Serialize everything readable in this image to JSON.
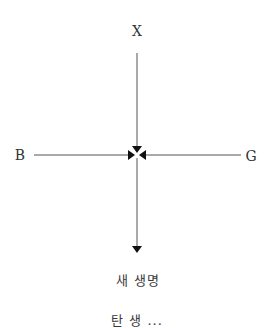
{
  "diagram": {
    "nodes": {
      "top": {
        "label": "X"
      },
      "left": {
        "label": "B"
      },
      "right": {
        "label": "G"
      },
      "result": {
        "label": "새 생명"
      },
      "bottom_cut": {
        "label": "탄 생 ..."
      }
    },
    "edges": [
      {
        "from": "X",
        "to": "center"
      },
      {
        "from": "B",
        "to": "center"
      },
      {
        "from": "G",
        "to": "center"
      },
      {
        "from": "center",
        "to": "새 생명"
      }
    ],
    "colors": {
      "line": "#555555",
      "arrow": "#111111",
      "text": "#333333"
    }
  }
}
